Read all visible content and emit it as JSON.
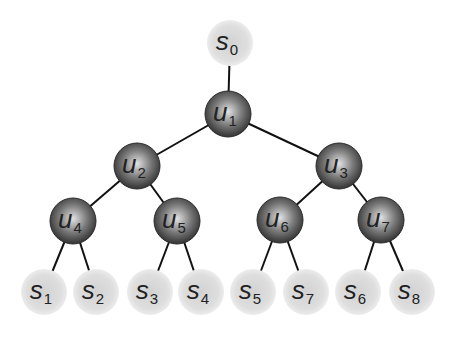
{
  "diagram": {
    "type": "binary tree",
    "colors": {
      "internal_node_dark": "#3a3a3a",
      "internal_node_light": "#d8d8d8",
      "leaf_node": "#dcdcdc",
      "leaf_node_edge": "#e9e9e9",
      "edge": "#111111",
      "label": "#222222"
    },
    "nodes": [
      {
        "id": "s0",
        "base": "s",
        "sub": "0",
        "kind": "leaf",
        "x": 230,
        "y": 43
      },
      {
        "id": "u1",
        "base": "u",
        "sub": "1",
        "kind": "internal",
        "x": 228,
        "y": 114
      },
      {
        "id": "u2",
        "base": "u",
        "sub": "2",
        "kind": "internal",
        "x": 137,
        "y": 166
      },
      {
        "id": "u3",
        "base": "u",
        "sub": "3",
        "kind": "internal",
        "x": 339,
        "y": 166
      },
      {
        "id": "u4",
        "base": "u",
        "sub": "4",
        "kind": "internal",
        "x": 73,
        "y": 221
      },
      {
        "id": "u5",
        "base": "u",
        "sub": "5",
        "kind": "internal",
        "x": 177,
        "y": 221
      },
      {
        "id": "u6",
        "base": "u",
        "sub": "6",
        "kind": "internal",
        "x": 280,
        "y": 220
      },
      {
        "id": "u7",
        "base": "u",
        "sub": "7",
        "kind": "internal",
        "x": 381,
        "y": 220
      },
      {
        "id": "s1",
        "base": "s",
        "sub": "1",
        "kind": "leaf",
        "x": 44,
        "y": 292
      },
      {
        "id": "s2",
        "base": "s",
        "sub": "2",
        "kind": "leaf",
        "x": 96,
        "y": 292
      },
      {
        "id": "s3",
        "base": "s",
        "sub": "3",
        "kind": "leaf",
        "x": 150,
        "y": 292
      },
      {
        "id": "s4",
        "base": "s",
        "sub": "4",
        "kind": "leaf",
        "x": 201,
        "y": 292
      },
      {
        "id": "s5",
        "base": "s",
        "sub": "5",
        "kind": "leaf",
        "x": 253,
        "y": 292
      },
      {
        "id": "s7",
        "base": "s",
        "sub": "7",
        "kind": "leaf",
        "x": 306,
        "y": 292
      },
      {
        "id": "s6",
        "base": "s",
        "sub": "6",
        "kind": "leaf",
        "x": 358,
        "y": 292
      },
      {
        "id": "s8",
        "base": "s",
        "sub": "8",
        "kind": "leaf",
        "x": 412,
        "y": 292
      }
    ],
    "edges": [
      [
        "s0",
        "u1"
      ],
      [
        "u1",
        "u2"
      ],
      [
        "u1",
        "u3"
      ],
      [
        "u2",
        "u4"
      ],
      [
        "u2",
        "u5"
      ],
      [
        "u3",
        "u6"
      ],
      [
        "u3",
        "u7"
      ],
      [
        "u4",
        "s1"
      ],
      [
        "u4",
        "s2"
      ],
      [
        "u5",
        "s3"
      ],
      [
        "u5",
        "s4"
      ],
      [
        "u6",
        "s5"
      ],
      [
        "u6",
        "s7"
      ],
      [
        "u7",
        "s6"
      ],
      [
        "u7",
        "s8"
      ]
    ],
    "node_radius": 23
  }
}
